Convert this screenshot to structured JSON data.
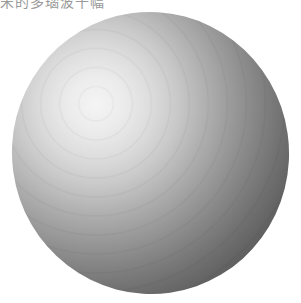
{
  "caption": {
    "text": "宋的多瑙波十幅"
  },
  "image": {
    "subject": "shaded-sphere",
    "highlight_color": "#f4f4f4",
    "shadow_color": "#474747",
    "background_color": "#ffffff"
  }
}
